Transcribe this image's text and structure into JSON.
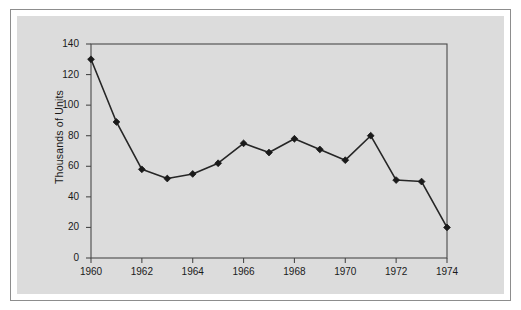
{
  "figure": {
    "background_color": "#ffffff",
    "panel_color": "#dcdcdc",
    "frame_color": "#8d8d8d",
    "line_color": "#262626",
    "marker_color": "#1a1a1a",
    "axis_color": "#4a4a4a"
  },
  "chart_data": {
    "type": "line",
    "title": "",
    "subtitle": "",
    "xlabel": "",
    "ylabel": "Thousands of Units",
    "x": [
      1960,
      1961,
      1962,
      1963,
      1964,
      1965,
      1966,
      1967,
      1968,
      1969,
      1970,
      1971,
      1972,
      1973,
      1974
    ],
    "values": [
      130,
      89,
      58,
      52,
      55,
      62,
      75,
      69,
      78,
      71,
      64,
      80,
      51,
      50,
      20
    ],
    "series": [
      {
        "name": "Units",
        "values": [
          130,
          89,
          58,
          52,
          55,
          62,
          75,
          69,
          78,
          71,
          64,
          80,
          51,
          50,
          20
        ]
      }
    ],
    "xlim": [
      1960,
      1974
    ],
    "ylim": [
      0,
      140
    ],
    "x_ticks": [
      1960,
      1962,
      1964,
      1966,
      1968,
      1970,
      1972,
      1974
    ],
    "x_tick_labels": [
      "1960",
      "1962",
      "1964",
      "1966",
      "1968",
      "1970",
      "1972",
      "1974"
    ],
    "y_ticks": [
      0,
      20,
      40,
      60,
      80,
      100,
      120,
      140
    ],
    "y_tick_labels": [
      "0",
      "20",
      "40",
      "60",
      "80",
      "100",
      "120",
      "140"
    ],
    "grid": false,
    "legend": false,
    "legend_position": "none",
    "marker": "diamond",
    "annotations": []
  }
}
